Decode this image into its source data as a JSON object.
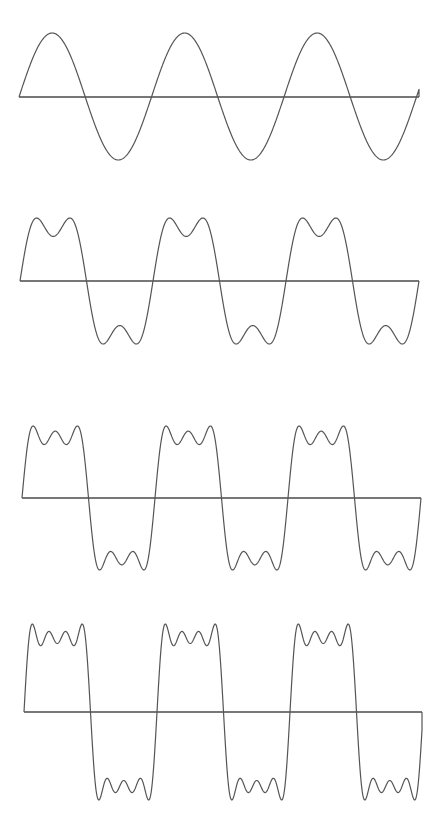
{
  "figure": {
    "background": "#ffffff",
    "stroke_color": "#555555",
    "axis_color": "#4a4a4a"
  },
  "panels": [
    {
      "id": "panel-1-harmonic",
      "harmonics": [
        1
      ],
      "axis_y": 97,
      "x_start": 19,
      "x_end": 419,
      "peak_y": 33,
      "trough_y": 160,
      "period_px": 132.5,
      "phase_x": 19
    },
    {
      "id": "panel-2-harmonics",
      "harmonics": [
        1,
        3
      ],
      "axis_y": 281,
      "x_start": 20,
      "x_end": 419,
      "peak_y": 218,
      "trough_y": 344,
      "period_px": 133,
      "phase_x": 20
    },
    {
      "id": "panel-3-harmonics",
      "harmonics": [
        1,
        3,
        5
      ],
      "axis_y": 498,
      "x_start": 22,
      "x_end": 421,
      "peak_y": 426,
      "trough_y": 570,
      "period_px": 133,
      "phase_x": 22
    },
    {
      "id": "panel-4-harmonics",
      "harmonics": [
        1,
        3,
        5,
        7
      ],
      "axis_y": 712,
      "x_start": 24,
      "x_end": 422,
      "peak_y": 624,
      "trough_y": 800,
      "period_px": 133,
      "phase_x": 24
    }
  ]
}
